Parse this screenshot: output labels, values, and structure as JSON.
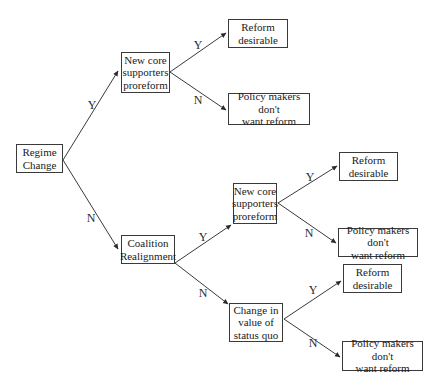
{
  "diagram": {
    "type": "decision-tree",
    "colors": {
      "line": "#3a3a3a",
      "text": "#1a1a1a",
      "background": "#ffffff"
    },
    "nodes": [
      {
        "id": "regime_change",
        "label": "Regime\nChange",
        "x": 16,
        "y": 144,
        "w": 47,
        "h": 29
      },
      {
        "id": "core_supporters_1",
        "label": "New core\nsupporters\nproreform",
        "x": 121,
        "y": 52,
        "w": 49,
        "h": 41
      },
      {
        "id": "reform_desirable_1",
        "label": "Reform\ndesirable",
        "x": 228,
        "y": 19,
        "w": 60,
        "h": 29
      },
      {
        "id": "policy_makers_1",
        "label": "Policy makers don't\nwant reform",
        "x": 228,
        "y": 93,
        "w": 82,
        "h": 32
      },
      {
        "id": "coalition_realignment",
        "label": "Coalition\nRealignment",
        "x": 121,
        "y": 235,
        "w": 54,
        "h": 29
      },
      {
        "id": "core_supporters_2",
        "label": "New core\nsupporters\nproreform",
        "x": 233,
        "y": 183,
        "w": 44,
        "h": 41
      },
      {
        "id": "reform_desirable_2",
        "label": "Reform\ndesirable",
        "x": 339,
        "y": 152,
        "w": 59,
        "h": 29
      },
      {
        "id": "policy_makers_2",
        "label": "Policy makers don't\nwant reform",
        "x": 338,
        "y": 228,
        "w": 80,
        "h": 29
      },
      {
        "id": "status_quo_change",
        "label": "Change in\nvalue of\nstatus quo",
        "x": 229,
        "y": 303,
        "w": 54,
        "h": 39
      },
      {
        "id": "reform_desirable_3",
        "label": "Reform\ndesirable",
        "x": 343,
        "y": 264,
        "w": 59,
        "h": 29
      },
      {
        "id": "policy_makers_3",
        "label": "Policy makers don't\nwant reform",
        "x": 342,
        "y": 341,
        "w": 81,
        "h": 30
      }
    ],
    "edges": [
      {
        "from": "regime_change",
        "to": "core_supporters_1",
        "label": "Y",
        "x1": 63,
        "y1": 160,
        "x2": 118,
        "y2": 71,
        "lx": 92,
        "ly": 105
      },
      {
        "from": "regime_change",
        "to": "coalition_realignment",
        "label": "N",
        "x1": 63,
        "y1": 160,
        "x2": 118,
        "y2": 249,
        "lx": 91,
        "ly": 218
      },
      {
        "from": "core_supporters_1",
        "to": "reform_desirable_1",
        "label": "Y",
        "x1": 170,
        "y1": 72,
        "x2": 226,
        "y2": 33,
        "lx": 198,
        "ly": 45
      },
      {
        "from": "core_supporters_1",
        "to": "policy_makers_1",
        "label": "N",
        "x1": 170,
        "y1": 72,
        "x2": 226,
        "y2": 110,
        "lx": 198,
        "ly": 100
      },
      {
        "from": "coalition_realignment",
        "to": "core_supporters_2",
        "label": "Y",
        "x1": 175,
        "y1": 263,
        "x2": 231,
        "y2": 225,
        "lx": 203,
        "ly": 237
      },
      {
        "from": "coalition_realignment",
        "to": "status_quo_change",
        "label": "N",
        "x1": 175,
        "y1": 263,
        "x2": 228,
        "y2": 304,
        "lx": 203,
        "ly": 293
      },
      {
        "from": "core_supporters_2",
        "to": "reform_desirable_2",
        "label": "Y",
        "x1": 278,
        "y1": 203,
        "x2": 337,
        "y2": 166,
        "lx": 310,
        "ly": 177
      },
      {
        "from": "core_supporters_2",
        "to": "policy_makers_2",
        "label": "N",
        "x1": 278,
        "y1": 203,
        "x2": 336,
        "y2": 243,
        "lx": 309,
        "ly": 233
      },
      {
        "from": "status_quo_change",
        "to": "reform_desirable_3",
        "label": "Y",
        "x1": 284,
        "y1": 319,
        "x2": 341,
        "y2": 281,
        "lx": 313,
        "ly": 290
      },
      {
        "from": "status_quo_change",
        "to": "policy_makers_3",
        "label": "N",
        "x1": 284,
        "y1": 319,
        "x2": 340,
        "y2": 357,
        "lx": 313,
        "ly": 343
      }
    ]
  }
}
